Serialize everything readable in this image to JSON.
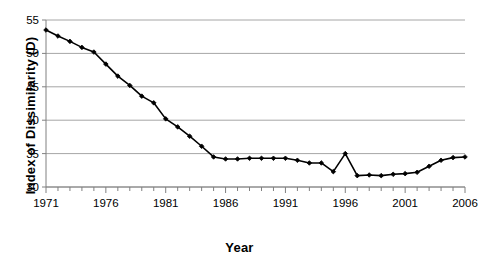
{
  "chart_data": {
    "type": "line",
    "title": "",
    "subtitle": "",
    "xlabel": "Year",
    "ylabel": "Index of Dissimilarity (D)",
    "xlim": [
      1971,
      2006
    ],
    "ylim": [
      30,
      55
    ],
    "xticks": [
      1971,
      1976,
      1981,
      1986,
      1991,
      1996,
      2001,
      2006
    ],
    "xtick_labels": [
      "1971",
      "1976",
      "1981",
      "1986",
      "1991",
      "1996",
      "2001",
      "2006"
    ],
    "yticks": [
      30,
      35,
      40,
      45,
      50,
      55
    ],
    "ytick_labels": [
      "30",
      "35",
      "40",
      "45",
      "50",
      "55"
    ],
    "minor_xticks_every": 1,
    "grid": "horizontal",
    "legend": "none",
    "marker": "filled-diamond",
    "line_color": "#000000",
    "marker_color": "#000000",
    "grid_color": "#a6a6a6",
    "axis_color": "#808080",
    "background_color": "#ffffff",
    "x": [
      1971,
      1972,
      1973,
      1974,
      1975,
      1976,
      1977,
      1978,
      1979,
      1980,
      1981,
      1982,
      1983,
      1984,
      1985,
      1986,
      1987,
      1988,
      1989,
      1990,
      1991,
      1992,
      1993,
      1994,
      1995,
      1996,
      1997,
      1998,
      1999,
      2000,
      2001,
      2002,
      2003,
      2004,
      2005,
      2006
    ],
    "values": [
      53.5,
      52.6,
      51.8,
      50.9,
      50.2,
      48.4,
      46.6,
      45.2,
      43.6,
      42.6,
      40.2,
      39.0,
      37.6,
      36.1,
      34.5,
      34.2,
      34.2,
      34.3,
      34.3,
      34.3,
      34.3,
      34.0,
      33.6,
      33.6,
      32.3,
      35.0,
      31.7,
      31.8,
      31.7,
      31.9,
      32.0,
      32.2,
      33.1,
      34.0,
      34.4,
      34.5
    ],
    "series": [
      {
        "name": "Index of Dissimilarity (D)",
        "values": [
          53.5,
          52.6,
          51.8,
          50.9,
          50.2,
          48.4,
          46.6,
          45.2,
          43.6,
          42.6,
          40.2,
          39.0,
          37.6,
          36.1,
          34.5,
          34.2,
          34.2,
          34.3,
          34.3,
          34.3,
          34.3,
          34.0,
          33.6,
          33.6,
          32.3,
          35.0,
          31.7,
          31.8,
          31.7,
          31.9,
          32.0,
          32.2,
          33.1,
          34.0,
          34.4,
          34.5
        ]
      }
    ],
    "annotations": []
  }
}
